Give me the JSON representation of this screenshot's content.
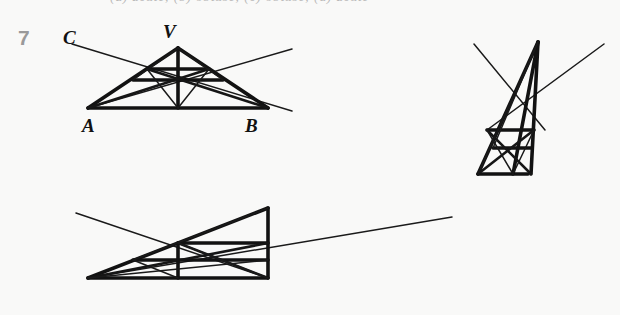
{
  "page": {
    "background_color": "#f9f9f8",
    "ink_color": "#121212",
    "number_color": "#9a9a9a",
    "clipped_top_line": "(a) acute; (b) obtuse; (c) obtuse; (d) acute"
  },
  "figures": [
    {
      "id": "fig7",
      "number": "7",
      "shape": "isosceles-triangle",
      "labels": {
        "C": "C",
        "V": "V",
        "A": "A",
        "B": "B"
      },
      "description": "Triangle with apex V over base AB, with cevians, a midsegment, an altitude from V, and two rays crossing through the interior extending beyond the triangle on both sides.",
      "vertices": {
        "A": [
          88,
          108
        ],
        "B": [
          268,
          108
        ],
        "V": [
          178,
          48
        ]
      },
      "ray_endpoints": {
        "from_C": [
          72,
          44
        ],
        "to_right": [
          292,
          49
        ]
      }
    },
    {
      "id": "fig9",
      "number": "9",
      "shape": "right-triangle-wide",
      "labels": {
        "C": "C",
        "V": "V",
        "A": "A",
        "B": "B"
      },
      "description": "Wide obtuse/right triangle with apex V above B, long base AB, multiple cevians and horizontal segments, a ray from C crossing the figure and a ray exiting far to the right.",
      "vertices": {
        "A": [
          88,
          278
        ],
        "B": [
          268,
          278
        ],
        "V": [
          268,
          208
        ]
      },
      "ray_endpoints": {
        "from_C": [
          76,
          213
        ],
        "to_right": [
          452,
          217
        ]
      }
    },
    {
      "id": "fig11",
      "number": "11",
      "shape": "tall-narrow-triangle",
      "labels": {
        "C": "C",
        "V": "V",
        "A": "A",
        "B": "B"
      },
      "description": "Tall narrow triangle with apex V, short base AB, interior cevians and two horizontal segments, with a ray from C descending into the figure and a ray exiting to the upper right.",
      "vertices": {
        "A": [
          478,
          174
        ],
        "B": [
          528,
          174
        ],
        "V": [
          538,
          42
        ]
      },
      "ray_endpoints": {
        "from_C": [
          474,
          44
        ],
        "to_right": [
          604,
          44
        ]
      }
    }
  ]
}
